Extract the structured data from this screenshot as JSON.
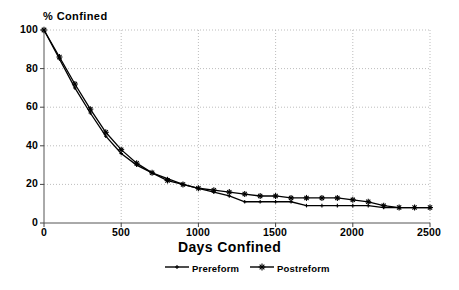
{
  "chart_data": {
    "type": "line",
    "title": "",
    "xlabel": "Days Confined",
    "ylabel": "% Confined",
    "xlim": [
      0,
      2500
    ],
    "ylim": [
      0,
      100
    ],
    "xticks": [
      0,
      500,
      1000,
      1500,
      2000,
      2500
    ],
    "yticks": [
      0,
      20,
      40,
      60,
      80,
      100
    ],
    "xtick_labels": [
      "0",
      "500",
      "1000",
      "1500",
      "2000",
      "2500"
    ],
    "ytick_labels": [
      "0",
      "20",
      "40",
      "60",
      "80",
      "100"
    ],
    "grid": true,
    "grid_style": "dotted",
    "legend_position": "below",
    "series": [
      {
        "name": "Prereform",
        "marker": "plus",
        "color": "#000000",
        "x": [
          0,
          100,
          200,
          300,
          400,
          500,
          600,
          700,
          800,
          900,
          1000,
          1100,
          1200,
          1300,
          1400,
          1500,
          1600,
          1700,
          1800,
          1900,
          2000,
          2100,
          2200,
          2300,
          2400,
          2500
        ],
        "y": [
          100,
          85,
          70,
          57,
          45,
          36,
          30,
          26,
          23,
          20,
          18,
          16,
          14,
          11,
          11,
          11,
          11,
          9,
          9,
          9,
          9,
          9,
          8,
          8,
          8,
          8
        ]
      },
      {
        "name": "Postreform",
        "marker": "star",
        "color": "#000000",
        "x": [
          0,
          100,
          200,
          300,
          400,
          500,
          600,
          700,
          800,
          900,
          1000,
          1100,
          1200,
          1300,
          1400,
          1500,
          1600,
          1700,
          1800,
          1900,
          2000,
          2100,
          2200,
          2300,
          2400,
          2500
        ],
        "y": [
          100,
          86,
          72,
          59,
          47,
          38,
          31,
          26,
          22,
          20,
          18,
          17,
          16,
          15,
          14,
          14,
          13,
          13,
          13,
          13,
          12,
          11,
          9,
          8,
          8,
          8
        ]
      }
    ]
  },
  "axes": {
    "ylabel": "% Confined",
    "xlabel": "Days Confined"
  },
  "legend": {
    "items": [
      {
        "label": "Prereform",
        "marker": "plus"
      },
      {
        "label": "Postreform",
        "marker": "star"
      }
    ]
  }
}
